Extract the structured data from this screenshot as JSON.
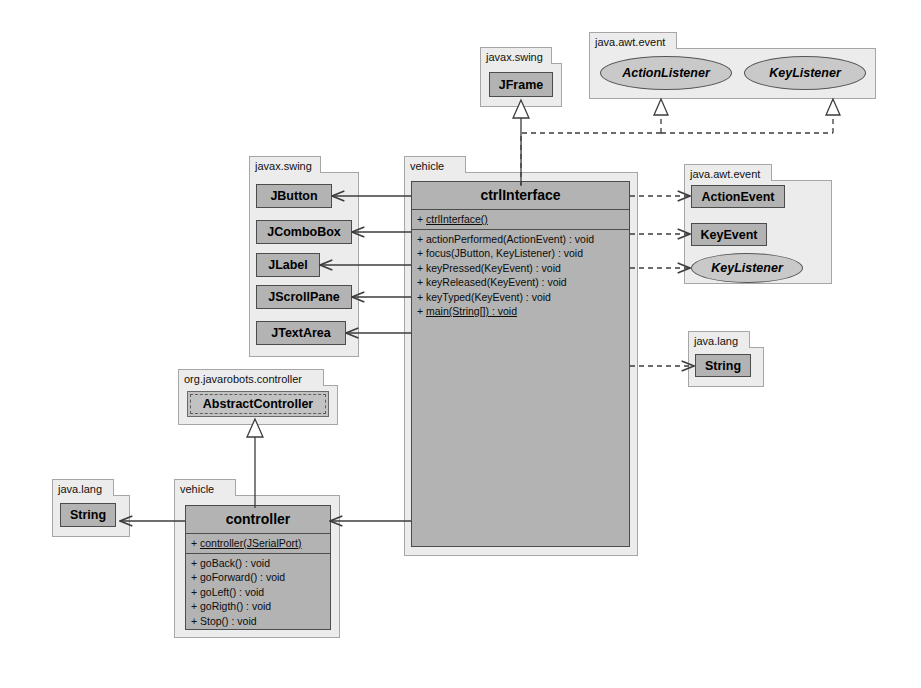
{
  "diagram": {
    "colors": {
      "class_fill": "#b3b3b3",
      "package_fill": "#ececec",
      "interface_fill": "#c9c9c9",
      "line": "#3c3c3c",
      "background": "#ffffff"
    }
  },
  "packages": [
    {
      "id": "pkg_swing_top",
      "label": "javax.swing"
    },
    {
      "id": "pkg_awt_top",
      "label": "java.awt.event"
    },
    {
      "id": "pkg_swing_left",
      "label": "javax.swing"
    },
    {
      "id": "pkg_vehicle_top",
      "label": "vehicle"
    },
    {
      "id": "pkg_awt_right",
      "label": "java.awt.event"
    },
    {
      "id": "pkg_lang_right",
      "label": "java.lang"
    },
    {
      "id": "pkg_orgjr",
      "label": "org.javarobots.controller"
    },
    {
      "id": "pkg_lang_left",
      "label": "java.lang"
    },
    {
      "id": "pkg_vehicle_bot",
      "label": "vehicle"
    }
  ],
  "classes": {
    "jframe": {
      "name": "JFrame"
    },
    "jbutton": {
      "name": "JButton"
    },
    "jcombobox": {
      "name": "JComboBox"
    },
    "jlabel": {
      "name": "JLabel"
    },
    "jscrollpane": {
      "name": "JScrollPane"
    },
    "jtextarea": {
      "name": "JTextArea"
    },
    "actionevent": {
      "name": "ActionEvent"
    },
    "keyevent": {
      "name": "KeyEvent"
    },
    "string_right": {
      "name": "String"
    },
    "string_left": {
      "name": "String"
    },
    "abstractcontroller": {
      "name": "AbstractController"
    },
    "ctrlinterface": {
      "name": "ctrlInterface",
      "constructors": [
        {
          "visibility": "+",
          "signature": "ctrlInterface()",
          "static": true
        }
      ],
      "methods": [
        {
          "visibility": "+",
          "signature": "actionPerformed(ActionEvent) : void",
          "static": false
        },
        {
          "visibility": "+",
          "signature": "focus(JButton, KeyListener) : void",
          "static": false
        },
        {
          "visibility": "+",
          "signature": "keyPressed(KeyEvent) : void",
          "static": false
        },
        {
          "visibility": "+",
          "signature": "keyReleased(KeyEvent) : void",
          "static": false
        },
        {
          "visibility": "+",
          "signature": "keyTyped(KeyEvent) : void",
          "static": false
        },
        {
          "visibility": "+",
          "signature": "main(String[]) : void",
          "static": true
        }
      ]
    },
    "controller": {
      "name": "controller",
      "constructors": [
        {
          "visibility": "+",
          "signature": "controller(JSerialPort)",
          "static": true
        }
      ],
      "methods": [
        {
          "visibility": "+",
          "signature": "goBack() : void",
          "static": false
        },
        {
          "visibility": "+",
          "signature": "goForward() : void",
          "static": false
        },
        {
          "visibility": "+",
          "signature": "goLeft() : void",
          "static": false
        },
        {
          "visibility": "+",
          "signature": "goRigth() : void",
          "static": false
        },
        {
          "visibility": "+",
          "signature": "Stop() : void",
          "static": false
        }
      ]
    }
  },
  "interfaces": {
    "actionlistener": {
      "name": "ActionListener"
    },
    "keylistener_top": {
      "name": "KeyListener"
    },
    "keylistener_right": {
      "name": "KeyListener"
    }
  },
  "relationships": [
    {
      "from": "ctrlInterface",
      "to": "JFrame",
      "type": "generalization"
    },
    {
      "from": "ctrlInterface",
      "to": "ActionListener",
      "type": "realization"
    },
    {
      "from": "ctrlInterface",
      "to": "KeyListener",
      "type": "realization"
    },
    {
      "from": "ctrlInterface",
      "to": "JButton",
      "type": "association"
    },
    {
      "from": "ctrlInterface",
      "to": "JComboBox",
      "type": "association"
    },
    {
      "from": "ctrlInterface",
      "to": "JLabel",
      "type": "association"
    },
    {
      "from": "ctrlInterface",
      "to": "JScrollPane",
      "type": "association"
    },
    {
      "from": "ctrlInterface",
      "to": "JTextArea",
      "type": "association"
    },
    {
      "from": "ctrlInterface",
      "to": "ActionEvent",
      "type": "dependency"
    },
    {
      "from": "ctrlInterface",
      "to": "KeyEvent",
      "type": "dependency"
    },
    {
      "from": "ctrlInterface",
      "to": "KeyListener",
      "type": "dependency"
    },
    {
      "from": "ctrlInterface",
      "to": "String",
      "type": "dependency"
    },
    {
      "from": "ctrlInterface",
      "to": "controller",
      "type": "association"
    },
    {
      "from": "controller",
      "to": "AbstractController",
      "type": "generalization"
    },
    {
      "from": "controller",
      "to": "String",
      "type": "association"
    }
  ]
}
